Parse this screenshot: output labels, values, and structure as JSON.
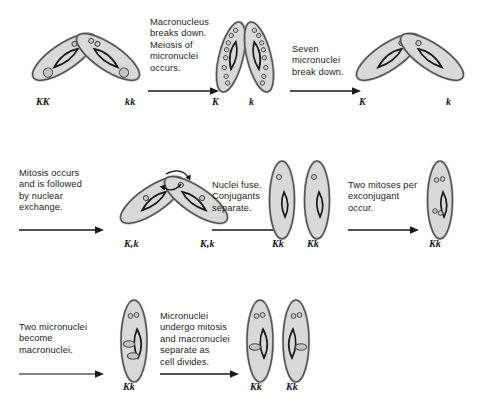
{
  "figure": {
    "background_color": "#ffffff",
    "cell_fill": "#d9d9d9",
    "cell_outline": "#1a1a1a",
    "nucleus_fill": "#c9c9c9",
    "text_color": "#1c1c1c"
  },
  "rows": [
    {
      "id": "row-1",
      "stages": [
        {
          "id": "stage-1",
          "kind": "conjugating-pair-tilted",
          "labels": [
            "KK",
            "kk"
          ],
          "micronuclei_per_cell": 2,
          "macronucleus": true
        },
        {
          "id": "stage-2",
          "kind": "conjugating-pair-upright",
          "labels": [
            "K",
            "k"
          ],
          "micronuclei_per_cell": 8,
          "macronucleus": false
        },
        {
          "id": "stage-3",
          "kind": "conjugating-pair-tilted",
          "labels": [
            "K",
            "k"
          ],
          "micronuclei_per_cell": 1,
          "macronucleus": false
        }
      ],
      "captions": [
        "Macronucleus\nbreaks down.\nMeiosis of\nmicronuclei\noccurs.",
        "Seven\nmicronuclei\nbreak down."
      ]
    },
    {
      "id": "row-2",
      "stages": [
        {
          "id": "stage-4",
          "kind": "conjugating-pair-exchange",
          "labels": [
            "K,k",
            "K,k"
          ],
          "micronuclei_per_cell": 2,
          "exchange_arrows": true
        },
        {
          "id": "stage-5",
          "kind": "separated-pair",
          "labels": [
            "Kk",
            "Kk"
          ],
          "micronuclei_per_cell": 1
        },
        {
          "id": "stage-6",
          "kind": "single-cell",
          "labels": [
            "Kk"
          ],
          "micronuclei_per_cell": 4
        }
      ],
      "captions": [
        "Mitosis occurs\nand is followed\nby nuclear\nexchange.",
        "Nuclei fuse.\nConjugants\nseparate.",
        "Two mitoses per\nexconjugant\noccur."
      ]
    },
    {
      "id": "row-3",
      "stages": [
        {
          "id": "stage-7",
          "kind": "single-cell-macronuclei",
          "labels": [
            "Kk"
          ],
          "micronuclei_per_cell": 2,
          "macronuclei_count": 2
        },
        {
          "id": "stage-8",
          "kind": "divided-pair",
          "labels": [
            "Kk",
            "Kk"
          ],
          "micronuclei_per_cell": 2,
          "macronuclei_count": 1
        }
      ],
      "captions": [
        "Two micronuclei\nbecome\nmacronuclei.",
        "Micronuclei\nundergo mitosis\nand macronuclei\nseparate as\ncell divides."
      ]
    }
  ],
  "captions_flat": [
    "Macronucleus\nbreaks down.\nMeiosis of\nmicronuclei\noccurs.",
    "Seven\nmicronuclei\nbreak down.",
    "Mitosis occurs\nand is followed\nby nuclear\nexchange.",
    "Nuclei fuse.\nConjugants\nseparate.",
    "Two mitoses per\nexconjugant\noccur.",
    "Two micronuclei\nbecome\nmacronuclei.",
    "Micronuclei\nundergo mitosis\nand macronuclei\nseparate as\ncell divides."
  ],
  "labels_flat": [
    "KK",
    "kk",
    "K",
    "k",
    "K",
    "k",
    "K,k",
    "K,k",
    "Kk",
    "Kk",
    "Kk",
    "Kk",
    "Kk",
    "Kk"
  ]
}
